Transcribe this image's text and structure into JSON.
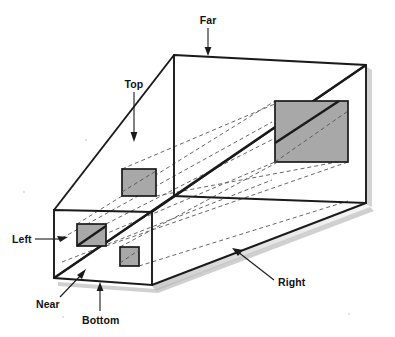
{
  "figure": {
    "type": "3d-box-perspective-diagram",
    "background_color": "#ffffff",
    "outline_color": "#1a1a1a",
    "quad_fill_color": "#a8a8a8",
    "quad_stroke_color": "#1a1a1a",
    "dashed_line_color": "#555555",
    "shadow_color": "#c9c9c9"
  },
  "labels": {
    "far": "Far",
    "top": "Top",
    "left": "Left",
    "near": "Near",
    "bottom": "Bottom",
    "right": "Right"
  },
  "geometry": {
    "near_plane": {
      "name": "near-plane",
      "corners": [
        [
          54,
          210
        ],
        [
          152,
          212
        ],
        [
          152,
          285
        ],
        [
          54,
          278
        ]
      ]
    },
    "far_plane": {
      "name": "far-plane",
      "corners": [
        [
          174,
          55
        ],
        [
          366,
          65
        ],
        [
          366,
          203
        ],
        [
          174,
          196
        ]
      ]
    },
    "top_face": {
      "name": "top-face",
      "corners": [
        [
          54,
          210
        ],
        [
          174,
          55
        ],
        [
          366,
          65
        ],
        [
          152,
          212
        ]
      ]
    },
    "right_face": {
      "name": "right-face",
      "corners": [
        [
          152,
          212
        ],
        [
          366,
          65
        ],
        [
          366,
          203
        ],
        [
          152,
          285
        ]
      ]
    },
    "bottom_face": {
      "name": "bottom-face",
      "corners": [
        [
          54,
          278
        ],
        [
          152,
          285
        ],
        [
          366,
          203
        ],
        [
          174,
          196
        ]
      ]
    },
    "quads": [
      {
        "name": "quad-far-large",
        "x": 275,
        "y": 101,
        "w": 73,
        "h": 61
      },
      {
        "name": "quad-mid-upper",
        "x": 122,
        "y": 169,
        "w": 34,
        "h": 27
      },
      {
        "name": "quad-near-left",
        "x": 77,
        "y": 224,
        "w": 29,
        "h": 22
      },
      {
        "name": "quad-near-small",
        "x": 120,
        "y": 247,
        "w": 19,
        "h": 19
      }
    ],
    "diagonal_edge": {
      "name": "near-far-diagonal",
      "from": [
        54,
        278
      ],
      "to": [
        366,
        65
      ]
    },
    "projection_lines": [
      {
        "from": [
          77,
          224
        ],
        "to": [
          275,
          101
        ]
      },
      {
        "from": [
          106,
          224
        ],
        "to": [
          348,
          101
        ]
      },
      {
        "from": [
          77,
          246
        ],
        "to": [
          275,
          162
        ]
      },
      {
        "from": [
          106,
          246
        ],
        "to": [
          348,
          162
        ]
      },
      {
        "from": [
          122,
          169
        ],
        "to": [
          275,
          101
        ]
      },
      {
        "from": [
          156,
          196
        ],
        "to": [
          348,
          162
        ]
      },
      {
        "from": [
          120,
          247
        ],
        "to": [
          275,
          162
        ]
      },
      {
        "from": [
          139,
          266
        ],
        "to": [
          348,
          203
        ]
      }
    ]
  },
  "annotations": [
    {
      "name": "far-annotation",
      "label_key": "far",
      "text_x": 208,
      "text_y": 22,
      "anchor": "middle",
      "leader_from": [
        208,
        28
      ],
      "leader_to": [
        208,
        54
      ],
      "arrow_at": [
        208,
        54
      ],
      "arrow_dir": "down"
    },
    {
      "name": "top-annotation",
      "label_key": "top",
      "text_x": 134,
      "text_y": 88,
      "anchor": "middle",
      "leader_from": [
        134,
        94
      ],
      "leader_to": [
        134,
        140
      ],
      "arrow_at": [
        134,
        140
      ],
      "arrow_dir": "down"
    },
    {
      "name": "left-annotation",
      "label_key": "left",
      "text_x": 12,
      "text_y": 243,
      "anchor": "start",
      "leader_from": [
        38,
        239
      ],
      "leader_to": [
        66,
        239
      ],
      "arrow_at": [
        66,
        239
      ],
      "arrow_dir": "right"
    },
    {
      "name": "near-annotation",
      "label_key": "near",
      "text_x": 38,
      "text_y": 302,
      "anchor": "start",
      "leader_from": [
        62,
        296
      ],
      "leader_to": [
        84,
        272
      ],
      "arrow_at": [
        84,
        272
      ],
      "arrow_dir": "upright"
    },
    {
      "name": "bottom-annotation",
      "label_key": "bottom",
      "text_x": 84,
      "text_y": 320,
      "anchor": "start",
      "leader_from": [
        100,
        312
      ],
      "leader_to": [
        100,
        284
      ],
      "arrow_at": [
        100,
        284
      ],
      "arrow_dir": "up"
    },
    {
      "name": "right-annotation",
      "label_key": "right",
      "text_x": 278,
      "text_y": 285,
      "anchor": "start",
      "leader_from": [
        273,
        280
      ],
      "leader_to": [
        234,
        250
      ],
      "arrow_at": [
        234,
        250
      ],
      "arrow_dir": "upleft"
    }
  ]
}
